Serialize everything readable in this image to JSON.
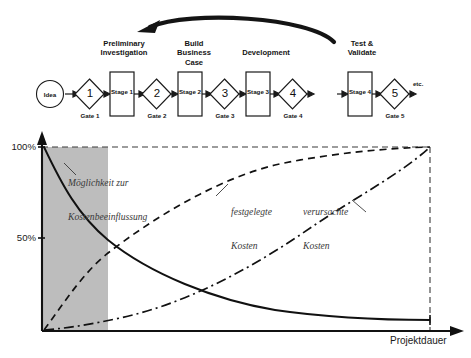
{
  "process": {
    "start_label": "Idea",
    "end_label": "etc.",
    "phases": [
      {
        "header": "Preliminary\nInvestigation",
        "stage": "Stage 1",
        "gate_num": "1",
        "gate_label": "Gate 1"
      },
      {
        "header": "Build\nBusiness\nCase",
        "stage": "Stage 2",
        "gate_num": "2",
        "gate_label": "Gate 2"
      },
      {
        "header": "Development",
        "stage": "Stage 3",
        "gate_num": "3",
        "gate_label": "Gate 3"
      },
      {
        "header": "Test &\nValidate",
        "stage": "Stage 4",
        "gate_num": "4",
        "gate_label": "Gate 4"
      }
    ],
    "final_gate": {
      "gate_num": "5",
      "gate_label": "Gate 5"
    },
    "feedback_arrow": "feedback-loop-arrow"
  },
  "chart_data": {
    "type": "line",
    "title": "",
    "xlabel": "Projektdauer",
    "ylabel": "",
    "xlim": [
      0,
      100
    ],
    "ylim": [
      0,
      100
    ],
    "grid": false,
    "legend": "inline-annotations",
    "ytick_labels": [
      "100%",
      "50%"
    ],
    "ytick_values": [
      100,
      50
    ],
    "xtick_labels": [],
    "shaded_region": {
      "name": "Möglichkeit zur Kostenbeeinflussung",
      "x_from": 0,
      "x_to": 17,
      "color": "#bdbdbd"
    },
    "reference_lines": [
      {
        "name": "100%-line",
        "orientation": "horizontal",
        "value": 100,
        "style": "dashed"
      },
      {
        "name": "project-end-line",
        "orientation": "vertical",
        "value": 100,
        "style": "dashed"
      }
    ],
    "series": [
      {
        "name": "Möglichkeit zur Kostenbeeinflussung",
        "style": "solid",
        "x": [
          0,
          5,
          10,
          15,
          20,
          25,
          30,
          40,
          50,
          60,
          70,
          80,
          90,
          100
        ],
        "values": [
          100,
          88,
          78,
          69,
          61,
          54,
          48,
          37,
          28,
          22,
          17,
          14,
          12,
          11
        ]
      },
      {
        "name": "festgelegte Kosten",
        "style": "dashed",
        "x": [
          0,
          5,
          10,
          15,
          20,
          25,
          30,
          40,
          50,
          60,
          70,
          80,
          90,
          100
        ],
        "values": [
          0,
          14,
          27,
          38,
          47,
          55,
          62,
          73,
          81,
          87,
          92,
          95,
          98,
          100
        ]
      },
      {
        "name": "verursachte Kosten",
        "style": "dash-dot",
        "x": [
          0,
          10,
          20,
          30,
          40,
          50,
          60,
          70,
          80,
          90,
          95,
          100
        ],
        "values": [
          0,
          2,
          5,
          9,
          15,
          22,
          31,
          43,
          57,
          74,
          86,
          100
        ]
      }
    ],
    "annotations": [
      {
        "name": "shaded-region-label",
        "text": "Möglichkeit zur\nKostenbeeinflussung"
      },
      {
        "name": "festgelegte-kosten-label",
        "text": "festgelegte\nKosten"
      },
      {
        "name": "verursachte-kosten-label",
        "text": "verursachte\nKosten"
      }
    ]
  },
  "labels": {
    "y_100": "100%",
    "y_50": "50%",
    "x_axis": "Projektdauer",
    "shaded_line1": "Möglichkeit zur",
    "shaded_line2": "Kostenbeeinflussung",
    "fest_line1": "festgelegte",
    "fest_line2": "Kosten",
    "ver_line1": "verursachte",
    "ver_line2": "Kosten"
  },
  "colors": {
    "ink": "#151515",
    "shade": "#bdbdbd",
    "label_gray": "#3a3a3a"
  }
}
